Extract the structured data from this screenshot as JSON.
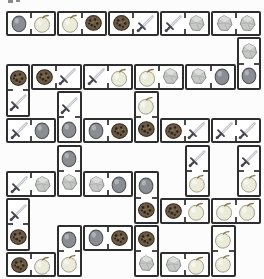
{
  "board": {
    "background": "#fcfcfc",
    "tile_fill": "#ffffff",
    "tile_border": "#2e2e2e",
    "divider_color": "#4a4a4a",
    "grid": {
      "origin_x": 5,
      "origin_y": 10,
      "cell_w": 25.7,
      "cell_h": 26.8,
      "cols": 10,
      "rows": 10,
      "tile_gap": 1
    },
    "icon_colors": {
      "plum": {
        "fill": "#8a8d92",
        "outline": "#54565c",
        "highlight": "#c2c4c8"
      },
      "apple": {
        "fill": "#eaecd9",
        "outline": "#9a9c86",
        "stem": "#8a7348",
        "highlight": "#ffffff"
      },
      "cookie": {
        "fill": "#6b5a46",
        "outline": "#3a2e20",
        "chip": "#2a2014",
        "spot": "#9d8a6b"
      },
      "sword": {
        "blade": "#c2c6cc",
        "blade_highlight": "#e9ebee",
        "hilt": "#45454d"
      },
      "stone": {
        "fill": "#c6c8c6",
        "outline": "#898b89",
        "light": "#dfe1df"
      }
    },
    "dominoes": [
      {
        "col": 0,
        "row": 0,
        "dir": "h",
        "a": "plum",
        "b": "apple"
      },
      {
        "col": 2,
        "row": 0,
        "dir": "h",
        "a": "apple",
        "b": "cookie"
      },
      {
        "col": 4,
        "row": 0,
        "dir": "h",
        "a": "cookie",
        "b": "sword"
      },
      {
        "col": 6,
        "row": 0,
        "dir": "h",
        "a": "sword",
        "b": "stone"
      },
      {
        "col": 8,
        "row": 0,
        "dir": "h",
        "a": "stone",
        "b": "stone"
      },
      {
        "col": 9,
        "row": 1,
        "dir": "v",
        "a": "stone",
        "b": "plum"
      },
      {
        "col": 7,
        "row": 2,
        "dir": "h",
        "a": "stone",
        "b": "plum"
      },
      {
        "col": 5,
        "row": 2,
        "dir": "h",
        "a": "apple",
        "b": "stone"
      },
      {
        "col": 3,
        "row": 2,
        "dir": "h",
        "a": "sword",
        "b": "apple"
      },
      {
        "col": 1,
        "row": 2,
        "dir": "h",
        "a": "cookie",
        "b": "sword"
      },
      {
        "col": 0,
        "row": 2,
        "dir": "v",
        "a": "cookie",
        "b": "sword"
      },
      {
        "col": 0,
        "row": 4,
        "dir": "h",
        "a": "sword",
        "b": "plum"
      },
      {
        "col": 2,
        "row": 3,
        "dir": "v",
        "a": "sword",
        "b": "plum"
      },
      {
        "col": 3,
        "row": 4,
        "dir": "h",
        "a": "plum",
        "b": "cookie"
      },
      {
        "col": 5,
        "row": 3,
        "dir": "v",
        "a": "apple",
        "b": "cookie"
      },
      {
        "col": 6,
        "row": 4,
        "dir": "h",
        "a": "cookie",
        "b": "sword"
      },
      {
        "col": 8,
        "row": 4,
        "dir": "h",
        "a": "sword",
        "b": "sword"
      },
      {
        "col": 7,
        "row": 5,
        "dir": "v",
        "a": "sword",
        "b": "apple"
      },
      {
        "col": 9,
        "row": 5,
        "dir": "v",
        "a": "sword",
        "b": "apple"
      },
      {
        "col": 2,
        "row": 5,
        "dir": "v",
        "a": "plum",
        "b": "stone"
      },
      {
        "col": 0,
        "row": 6,
        "dir": "h",
        "a": "sword",
        "b": "stone"
      },
      {
        "col": 3,
        "row": 6,
        "dir": "h",
        "a": "stone",
        "b": "plum"
      },
      {
        "col": 5,
        "row": 6,
        "dir": "v",
        "a": "plum",
        "b": "cookie"
      },
      {
        "col": 6,
        "row": 7,
        "dir": "h",
        "a": "cookie",
        "b": "apple"
      },
      {
        "col": 8,
        "row": 7,
        "dir": "h",
        "a": "apple",
        "b": "apple"
      },
      {
        "col": 0,
        "row": 7,
        "dir": "v",
        "a": "sword",
        "b": "cookie"
      },
      {
        "col": 3,
        "row": 8,
        "dir": "h",
        "a": "plum",
        "b": "cookie"
      },
      {
        "col": 2,
        "row": 8,
        "dir": "v",
        "a": "plum",
        "b": "apple"
      },
      {
        "col": 5,
        "row": 8,
        "dir": "v",
        "a": "cookie",
        "b": "stone"
      },
      {
        "col": 8,
        "row": 8,
        "dir": "v",
        "a": "apple",
        "b": "apple"
      },
      {
        "col": 0,
        "row": 9,
        "dir": "h",
        "a": "cookie",
        "b": "apple"
      },
      {
        "col": 6,
        "row": 9,
        "dir": "h",
        "a": "stone",
        "b": "apple"
      }
    ]
  }
}
